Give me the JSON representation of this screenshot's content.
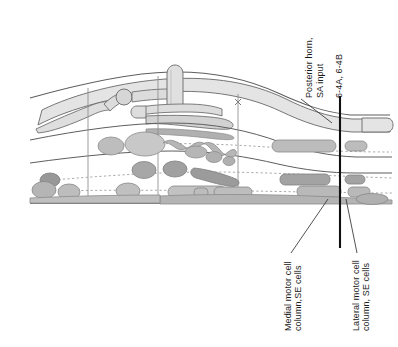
{
  "figure": {
    "kind": "anatomical-schematic",
    "background_color": "#ffffff",
    "ink_color": "#1c1c1c"
  },
  "labels": {
    "posterior_horn": {
      "text": "Posterior horn,\nSA input",
      "orientation": "vertical-bottom-to-top",
      "x": 306,
      "y": 98
    },
    "figure_ref": {
      "text": "6-4A, 6-4B",
      "orientation": "vertical-bottom-to-top",
      "x": 334,
      "y": 98
    },
    "medial_motor": {
      "text": "Medial motor cell\ncolumn,SE cells",
      "orientation": "vertical-bottom-to-top",
      "x": 285,
      "y": 330
    },
    "lateral_motor": {
      "text": "Lateral motor cell\ncolumn, SE cells",
      "orientation": "vertical-bottom-to-top",
      "x": 353,
      "y": 330
    }
  },
  "colors": {
    "outline": "#6f6f6f",
    "outline_dark": "#4a4a4a",
    "fill_light": "#e2e2e2",
    "fill_mid": "#c6c6c6",
    "fill_dark": "#a8a8a8",
    "fill_darker": "#949494",
    "marker_line": "#111111",
    "divider": "#8d8d8d",
    "dotted": "#9a9a9a",
    "baseline": "#555555"
  },
  "marker_line": {
    "name": "section-level-marker",
    "x": 340,
    "y_top": 96,
    "y_bottom": 248
  },
  "leader_lines": [
    {
      "name": "leader-posterior-horn",
      "x1": 303,
      "y1": 101,
      "x2": 331,
      "y2": 122
    },
    {
      "name": "leader-medial-motor",
      "x1": 291,
      "y1": 253,
      "x2": 327,
      "y2": 199
    },
    {
      "name": "leader-lateral-motor",
      "x1": 357,
      "y1": 253,
      "x2": 345,
      "y2": 199
    }
  ],
  "dividers": [
    {
      "name": "segment-divider-1",
      "x": 88,
      "y1": 88,
      "y2": 203
    },
    {
      "name": "segment-divider-2",
      "x": 158,
      "y1": 76,
      "y2": 203
    },
    {
      "name": "segment-divider-3",
      "x": 238,
      "y1": 94,
      "y2": 203
    }
  ],
  "bands": {
    "baseline_y": 203,
    "mid_band_note": "curved boundary lines separating posterior horn, intermediate and anterior gray matter"
  }
}
